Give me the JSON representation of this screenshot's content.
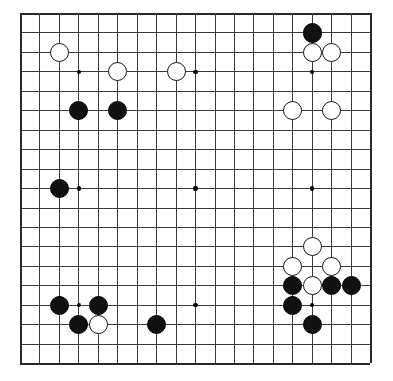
{
  "board": {
    "name": "go-board",
    "size": 19,
    "origin_x": 20,
    "origin_y": 13,
    "spacing": 19.45,
    "stone_radius": 9.6,
    "hoshi_radius": 2.2,
    "line_color": "#3a3a3a",
    "edge_color": "#2a2a2a",
    "background_color": "#ffffff",
    "black_color": "#111111",
    "white_color": "#ffffff",
    "white_border_color": "#1a1a1a",
    "hoshi_points": [
      {
        "col": 3,
        "row": 3
      },
      {
        "col": 9,
        "row": 3
      },
      {
        "col": 15,
        "row": 3
      },
      {
        "col": 3,
        "row": 9
      },
      {
        "col": 9,
        "row": 9
      },
      {
        "col": 15,
        "row": 9
      },
      {
        "col": 3,
        "row": 15
      },
      {
        "col": 9,
        "row": 15
      },
      {
        "col": 15,
        "row": 15
      }
    ],
    "stones": [
      {
        "col": 15,
        "row": 1,
        "color": "black",
        "label": "black-stone-q18"
      },
      {
        "col": 15,
        "row": 2,
        "color": "white",
        "label": "white-stone-q17"
      },
      {
        "col": 16,
        "row": 2,
        "color": "white",
        "label": "white-stone-r17"
      },
      {
        "col": 2,
        "row": 2,
        "color": "white",
        "label": "white-stone-c17"
      },
      {
        "col": 5,
        "row": 3,
        "color": "white",
        "label": "white-stone-f16"
      },
      {
        "col": 8,
        "row": 3,
        "color": "white",
        "label": "white-stone-j16"
      },
      {
        "col": 3,
        "row": 5,
        "color": "black",
        "label": "black-stone-d14"
      },
      {
        "col": 5,
        "row": 5,
        "color": "black",
        "label": "black-stone-f14"
      },
      {
        "col": 14,
        "row": 5,
        "color": "white",
        "label": "white-stone-p14"
      },
      {
        "col": 16,
        "row": 5,
        "color": "white",
        "label": "white-stone-r14"
      },
      {
        "col": 2,
        "row": 9,
        "color": "black",
        "label": "black-stone-c10"
      },
      {
        "col": 15,
        "row": 12,
        "color": "white",
        "label": "white-stone-q7"
      },
      {
        "col": 14,
        "row": 13,
        "color": "white",
        "label": "white-stone-p6"
      },
      {
        "col": 16,
        "row": 13,
        "color": "white",
        "label": "white-stone-r6"
      },
      {
        "col": 14,
        "row": 14,
        "color": "black",
        "label": "black-stone-p5"
      },
      {
        "col": 15,
        "row": 14,
        "color": "white",
        "label": "white-stone-q5"
      },
      {
        "col": 16,
        "row": 14,
        "color": "black",
        "label": "black-stone-r5"
      },
      {
        "col": 17,
        "row": 14,
        "color": "black",
        "label": "black-stone-s5"
      },
      {
        "col": 14,
        "row": 15,
        "color": "black",
        "label": "black-stone-p4"
      },
      {
        "col": 15,
        "row": 16,
        "color": "black",
        "label": "black-stone-q3"
      },
      {
        "col": 2,
        "row": 15,
        "color": "black",
        "label": "black-stone-c4"
      },
      {
        "col": 4,
        "row": 15,
        "color": "black",
        "label": "black-stone-e4"
      },
      {
        "col": 3,
        "row": 16,
        "color": "black",
        "label": "black-stone-d3"
      },
      {
        "col": 4,
        "row": 16,
        "color": "white",
        "label": "white-stone-e3"
      },
      {
        "col": 7,
        "row": 16,
        "color": "black",
        "label": "black-stone-h3"
      }
    ]
  },
  "meta": {
    "black_count": "13",
    "white_count": "12"
  }
}
